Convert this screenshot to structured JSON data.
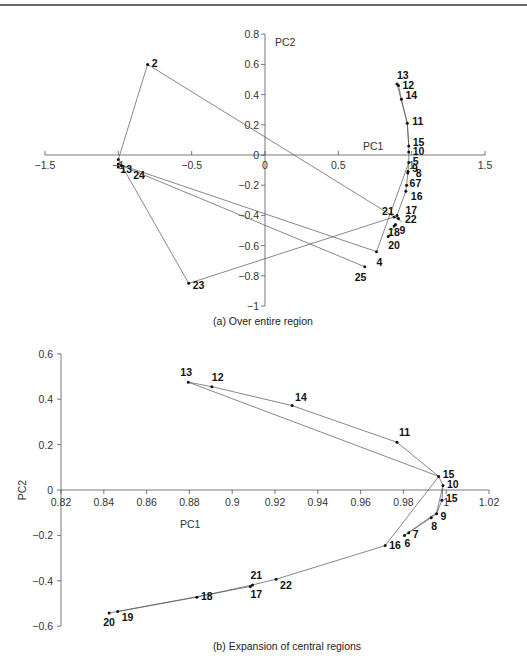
{
  "chart_data": [
    {
      "type": "scatter",
      "id": "a",
      "title": "(a) Over entire region",
      "xlabel": "PC1",
      "ylabel": "PC2",
      "xlim": [
        -1.5,
        1.5
      ],
      "ylim": [
        -1,
        0.8
      ],
      "xticks": [
        -1.5,
        -1,
        -0.5,
        0,
        0.5,
        1,
        1.5
      ],
      "xtick_labels": [
        "-1.5",
        "-1",
        "-0.5",
        "0",
        "0.5",
        "1",
        "1.5"
      ],
      "yticks": [
        0.8,
        0.6,
        0.4,
        0.2,
        0,
        -0.2,
        -0.4,
        -0.6,
        -0.8,
        -1
      ],
      "ytick_labels": [
        "0.8",
        "0.6",
        "0.4",
        "0.2",
        "0",
        "-0.2",
        "-0.4",
        "-0.6",
        "-0.8",
        "-1"
      ],
      "grid": false,
      "connected": true,
      "points": [
        {
          "label": "1",
          "x": -1.0,
          "y": -0.03,
          "dx": 0,
          "dy": 0,
          "show": false
        },
        {
          "label": "2",
          "x": -0.8,
          "y": 0.6,
          "dx": 4,
          "dy": 3
        },
        {
          "label": "13",
          "x": -1.0,
          "y": -0.06,
          "dx": 2,
          "dy": 9,
          "text": "13"
        },
        {
          "label": "24",
          "x": -0.98,
          "y": -0.07,
          "dx": 12,
          "dy": 13
        },
        {
          "label": "25",
          "x": 0.68,
          "y": -0.74,
          "dx": -10,
          "dy": 14
        },
        {
          "label": "3",
          "x": -1.0,
          "y": -0.08,
          "show": false
        },
        {
          "label": "23",
          "x": -0.52,
          "y": -0.85,
          "dx": 4,
          "dy": 6
        },
        {
          "label": "21",
          "x": 0.88,
          "y": -0.41,
          "dx": -12,
          "dy": -2
        },
        {
          "label": "4",
          "x": 0.76,
          "y": -0.64,
          "dx": 0,
          "dy": 14
        },
        {
          "label": "13",
          "x": 0.9,
          "y": 0.47,
          "dx": 0,
          "dy": -5
        },
        {
          "label": "12",
          "x": 0.91,
          "y": 0.46,
          "dx": 4,
          "dy": 3
        },
        {
          "label": "14",
          "x": 0.93,
          "y": 0.37,
          "dx": 4,
          "dy": 0
        },
        {
          "label": "11",
          "x": 0.97,
          "y": 0.21,
          "dx": 5,
          "dy": 2
        },
        {
          "label": "15",
          "x": 0.98,
          "y": 0.06,
          "dx": 4,
          "dy": 0
        },
        {
          "label": "10",
          "x": 0.98,
          "y": 0.02,
          "dx": 4,
          "dy": 3
        },
        {
          "label": "5",
          "x": 0.98,
          "y": -0.05,
          "dx": 4,
          "dy": 2
        },
        {
          "label": "9",
          "x": 0.975,
          "y": -0.11,
          "dx": 4,
          "dy": 0
        },
        {
          "label": "8",
          "x": 0.973,
          "y": -0.12,
          "dx": 8,
          "dy": 4
        },
        {
          "label": "67",
          "x": 0.965,
          "y": -0.2,
          "dx": 3,
          "dy": 2
        },
        {
          "label": "16",
          "x": 0.96,
          "y": -0.24,
          "dx": 5,
          "dy": 9
        },
        {
          "label": "17",
          "x": 0.91,
          "y": -0.42,
          "dx": 7,
          "dy": -4
        },
        {
          "label": "22",
          "x": 0.9,
          "y": -0.4,
          "dx": 8,
          "dy": 8
        },
        {
          "label": "18",
          "x": 0.88,
          "y": -0.47,
          "dx": -6,
          "dy": 10
        },
        {
          "label": "9",
          "x": 0.89,
          "y": -0.46,
          "dx": 4,
          "dy": 10,
          "text": "9"
        },
        {
          "label": "20",
          "x": 0.84,
          "y": -0.54,
          "dx": 0,
          "dy": 12
        }
      ],
      "path": [
        [
          -0.8,
          0.6
        ],
        [
          -1.0,
          -0.03
        ],
        [
          -0.52,
          -0.85
        ],
        [
          0.88,
          -0.41
        ],
        [
          0.91,
          -0.42
        ],
        [
          0.9,
          -0.4
        ],
        [
          0.96,
          -0.24
        ],
        [
          0.965,
          -0.2
        ],
        [
          0.975,
          -0.11
        ],
        [
          0.98,
          -0.05
        ],
        [
          0.98,
          0.02
        ],
        [
          0.98,
          0.06
        ],
        [
          0.97,
          0.21
        ],
        [
          0.93,
          0.37
        ],
        [
          0.91,
          0.46
        ],
        [
          0.9,
          0.47
        ]
      ],
      "extra_segments": [
        [
          [
            -0.8,
            0.6
          ],
          [
            0.93,
            -0.44
          ]
        ],
        [
          [
            -1.0,
            -0.06
          ],
          [
            0.76,
            -0.64
          ]
        ],
        [
          [
            -0.98,
            -0.07
          ],
          [
            0.68,
            -0.74
          ]
        ],
        [
          [
            0.76,
            -0.64
          ],
          [
            0.98,
            -0.05
          ]
        ],
        [
          [
            0.84,
            -0.54
          ],
          [
            0.89,
            -0.46
          ]
        ],
        [
          [
            0.9,
            0.47
          ],
          [
            0.97,
            0.21
          ]
        ],
        [
          [
            0.97,
            0.21
          ],
          [
            0.98,
            0.06
          ]
        ]
      ]
    },
    {
      "type": "scatter",
      "id": "b",
      "title": "(b) Expansion of central regions",
      "xlabel": "PC1",
      "ylabel": "PC2",
      "xlim": [
        0.82,
        1.02
      ],
      "ylim": [
        -0.6,
        0.6
      ],
      "xticks": [
        0.82,
        0.84,
        0.86,
        0.88,
        0.9,
        0.92,
        0.94,
        0.96,
        0.98,
        1,
        1.02
      ],
      "xtick_labels": [
        "0.82",
        "0.84",
        "0.86",
        "0.88",
        "0.9",
        "0.92",
        "0.94",
        "0.96",
        "0.98",
        "1",
        "1.02"
      ],
      "yticks": [
        0.6,
        0.4,
        0.2,
        0,
        -0.2,
        -0.4,
        -0.6
      ],
      "ytick_labels": [
        "0.6",
        "0.4",
        "0.2",
        "0",
        "-0.2",
        "-0.4",
        "-0.6"
      ],
      "grid": false,
      "connected": true,
      "points": [
        {
          "label": "13",
          "x": 0.8795,
          "y": 0.475,
          "dx": -8,
          "dy": -6
        },
        {
          "label": "12",
          "x": 0.8905,
          "y": 0.455,
          "dx": 0,
          "dy": -6
        },
        {
          "label": "14",
          "x": 0.928,
          "y": 0.372,
          "dx": 3,
          "dy": -5
        },
        {
          "label": "11",
          "x": 0.977,
          "y": 0.21,
          "dx": 2,
          "dy": -6
        },
        {
          "label": "15",
          "x": 0.9965,
          "y": 0.06,
          "dx": 4,
          "dy": 2
        },
        {
          "label": "10",
          "x": 0.9985,
          "y": 0.02,
          "dx": 4,
          "dy": 3
        },
        {
          "label": "15",
          "x": 0.998,
          "y": -0.045,
          "dx": 4,
          "dy": 2
        },
        {
          "label": "9",
          "x": 0.9955,
          "y": -0.105,
          "dx": 4,
          "dy": 6
        },
        {
          "label": "8",
          "x": 0.993,
          "y": -0.122,
          "dx": 0,
          "dy": 12
        },
        {
          "label": "7",
          "x": 0.9825,
          "y": -0.188,
          "dx": 4,
          "dy": 5
        },
        {
          "label": "6",
          "x": 0.9805,
          "y": -0.2,
          "dx": 0,
          "dy": 12
        },
        {
          "label": "16",
          "x": 0.9715,
          "y": -0.245,
          "dx": 4,
          "dy": 3
        },
        {
          "label": "22",
          "x": 0.9205,
          "y": -0.393,
          "dx": 4,
          "dy": 10
        },
        {
          "label": "21",
          "x": 0.9095,
          "y": -0.418,
          "dx": -2,
          "dy": -6
        },
        {
          "label": "17",
          "x": 0.9085,
          "y": -0.425,
          "dx": 0,
          "dy": 12
        },
        {
          "label": "18",
          "x": 0.8835,
          "y": -0.472,
          "dx": 4,
          "dy": 3
        },
        {
          "label": "19",
          "x": 0.8465,
          "y": -0.535,
          "dx": 4,
          "dy": 10
        },
        {
          "label": "20",
          "x": 0.8425,
          "y": -0.542,
          "dx": -6,
          "dy": 13
        }
      ],
      "path": [
        [
          0.8795,
          0.475
        ],
        [
          0.8905,
          0.455
        ],
        [
          0.928,
          0.372
        ],
        [
          0.977,
          0.21
        ],
        [
          0.9965,
          0.06
        ],
        [
          0.9985,
          0.02
        ],
        [
          0.998,
          -0.045
        ],
        [
          0.9955,
          -0.105
        ],
        [
          0.993,
          -0.122
        ],
        [
          0.9825,
          -0.188
        ],
        [
          0.9805,
          -0.2
        ]
      ],
      "extra_segments": [
        [
          [
            0.8795,
            0.475
          ],
          [
            0.9965,
            0.06
          ]
        ],
        [
          [
            0.9965,
            0.06
          ],
          [
            0.9715,
            -0.245
          ]
        ],
        [
          [
            0.9715,
            -0.245
          ],
          [
            0.9205,
            -0.393
          ]
        ],
        [
          [
            0.9205,
            -0.393
          ],
          [
            0.9095,
            -0.418
          ]
        ],
        [
          [
            0.9095,
            -0.418
          ],
          [
            0.8835,
            -0.472
          ]
        ],
        [
          [
            0.8835,
            -0.472
          ],
          [
            0.8425,
            -0.542
          ]
        ],
        [
          [
            0.8465,
            -0.535
          ],
          [
            0.8835,
            -0.47
          ]
        ],
        [
          [
            0.8835,
            -0.47
          ],
          [
            0.9085,
            -0.425
          ]
        ],
        [
          [
            0.9805,
            -0.2
          ],
          [
            0.9955,
            -0.1
          ]
        ],
        [
          [
            0.9955,
            -0.1
          ],
          [
            0.9985,
            0.02
          ]
        ]
      ]
    }
  ]
}
